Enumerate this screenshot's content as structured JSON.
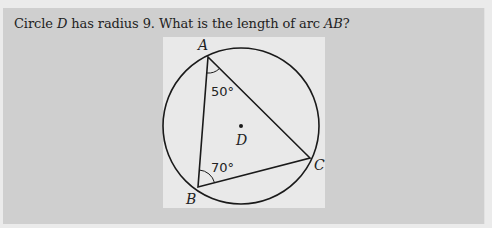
{
  "question": {
    "prefix": "Circle ",
    "circle_name": "D",
    "middle": " has radius 9. What is the length of arc ",
    "arc_name": "AB",
    "suffix": "?"
  },
  "figure": {
    "center_label": "D",
    "points": [
      {
        "label": "A",
        "x": 208,
        "y": 57
      },
      {
        "label": "B",
        "x": 198,
        "y": 187
      },
      {
        "label": "C",
        "x": 310,
        "y": 158
      }
    ],
    "angles": [
      {
        "vertex": "A",
        "label": "50°"
      },
      {
        "vertex": "B",
        "label": "70°"
      }
    ],
    "circle": {
      "cx": 241,
      "cy": 126,
      "r": 78
    },
    "stroke_color": "#1a1a1a"
  }
}
